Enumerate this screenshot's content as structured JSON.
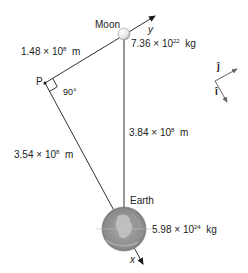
{
  "bodies": {
    "moon": {
      "label": "Moon",
      "mass_mantissa": "7.36",
      "mass_exp": "22",
      "mass_unit": "kg",
      "times": "×",
      "ten": "10"
    },
    "earth": {
      "label": "Earth",
      "mass_mantissa": "5.98",
      "mass_exp": "24",
      "mass_unit": "kg",
      "times": "×",
      "ten": "10"
    }
  },
  "point": {
    "label": "P",
    "angle": "90°"
  },
  "distances": {
    "p_to_moon": {
      "mantissa": "1.48",
      "exp": "8",
      "unit": "m",
      "times": "×",
      "ten": "10"
    },
    "p_to_earth": {
      "mantissa": "3.54",
      "exp": "8",
      "unit": "m",
      "times": "×",
      "ten": "10"
    },
    "earth_to_moon": {
      "mantissa": "3.84",
      "exp": "8",
      "unit": "m",
      "times": "×",
      "ten": "10"
    }
  },
  "axes": {
    "x": "x",
    "y": "y"
  },
  "unit_vectors": {
    "i": "î",
    "j": "ĵ"
  },
  "colors": {
    "line": "#1a1a1a",
    "earth_fill": "#8a8a8a",
    "moon_fill": "#f2f2f2",
    "vector": "#555555"
  }
}
